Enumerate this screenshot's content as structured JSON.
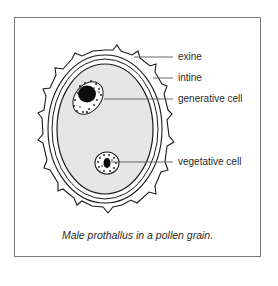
{
  "figure": {
    "caption": "Male prothallus in a pollen grain.",
    "labels": {
      "exine": "exine",
      "intine": "intine",
      "generative_cell": "generative cell",
      "vegetative_cell": "vegetative cell"
    }
  },
  "colors": {
    "outline": "#1a1a1a",
    "cytoplasm": "#e6e6e6",
    "frame": "#7a7a7a",
    "leader_line": "#555555"
  }
}
